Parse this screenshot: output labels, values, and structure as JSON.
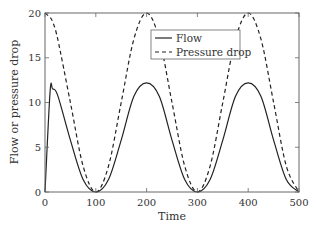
{
  "chart_data": {
    "type": "line",
    "title": "",
    "xlabel": "Time",
    "ylabel": "Flow or pressure drop",
    "xlim": [
      0,
      500
    ],
    "ylim": [
      0,
      20
    ],
    "xticks": [
      0,
      100,
      200,
      300,
      400,
      500
    ],
    "yticks": [
      0,
      5,
      10,
      15,
      20
    ],
    "grid": false,
    "legend_position": "upper center-right",
    "x": [
      0,
      10,
      15,
      25,
      50,
      75,
      100,
      125,
      150,
      175,
      200,
      225,
      250,
      275,
      300,
      325,
      350,
      375,
      400,
      425,
      450,
      475,
      500
    ],
    "series": [
      {
        "name": "Flow",
        "style": "solid",
        "values": [
          0,
          11.2,
          11.5,
          10.8,
          5.8,
          1.4,
          0.0,
          1.4,
          5.8,
          10.7,
          12.2,
          10.7,
          5.8,
          1.4,
          0.0,
          1.4,
          5.8,
          10.7,
          12.2,
          10.7,
          5.8,
          1.4,
          0.0
        ]
      },
      {
        "name": "Pressure drop",
        "style": "dashed",
        "values": [
          20,
          19.5,
          19.0,
          17.1,
          10.0,
          2.9,
          0.0,
          2.9,
          10.0,
          17.1,
          20.0,
          17.1,
          10.0,
          2.9,
          0.0,
          2.9,
          10.0,
          17.1,
          20.0,
          17.1,
          10.0,
          2.9,
          0.0
        ]
      }
    ]
  },
  "legend": {
    "items": [
      {
        "label": "Flow"
      },
      {
        "label": "Pressure drop"
      }
    ]
  },
  "colors": {
    "line": "#222222",
    "axis": "#555555",
    "text": "#333333"
  }
}
